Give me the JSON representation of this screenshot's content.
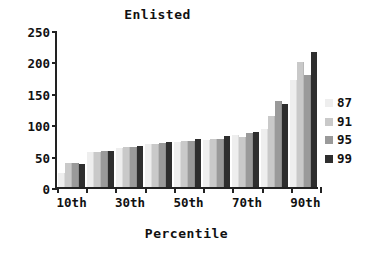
{
  "chart_data": {
    "type": "bar",
    "title": "Enlisted",
    "xlabel": "Percentile",
    "ylabel": "",
    "ylim": [
      0,
      250
    ],
    "yticks": [
      0,
      50,
      100,
      150,
      200,
      250
    ],
    "grid": false,
    "legend_position": "right",
    "categories": [
      "10th",
      "20th",
      "30th",
      "40th",
      "50th",
      "60th",
      "70th",
      "80th",
      "90th"
    ],
    "visible_tick_labels": [
      "10th",
      "30th",
      "50th",
      "70th",
      "90th"
    ],
    "series": [
      {
        "name": "87",
        "color": "#eeeeee",
        "values": [
          22,
          55,
          62,
          68,
          72,
          75,
          83,
          93,
          170
        ]
      },
      {
        "name": "91",
        "color": "#c9c9c9",
        "values": [
          38,
          56,
          63,
          69,
          73,
          76,
          80,
          113,
          199
        ]
      },
      {
        "name": "95",
        "color": "#9a9a9a",
        "values": [
          39,
          57,
          64,
          70,
          74,
          77,
          86,
          137,
          178
        ]
      },
      {
        "name": "99",
        "color": "#2e2e2e",
        "values": [
          37,
          57,
          65,
          72,
          76,
          81,
          88,
          132,
          215
        ]
      }
    ]
  }
}
